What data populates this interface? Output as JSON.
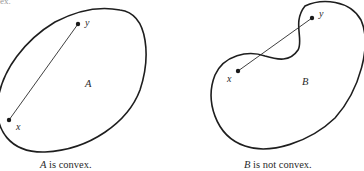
{
  "top_fragment": "ex.",
  "figures": [
    {
      "id": "A",
      "set_label": "A",
      "point_labels": {
        "x": "x",
        "y": "y"
      },
      "caption": {
        "set": "A",
        "text": " is convex."
      },
      "convex": true
    },
    {
      "id": "B",
      "set_label": "B",
      "point_labels": {
        "x": "x",
        "y": "y"
      },
      "caption": {
        "set": "B",
        "text": " is not convex."
      },
      "convex": false
    }
  ],
  "colors": {
    "stroke": "#1e1e1e",
    "text": "#2a2a2a",
    "background": "#ffffff"
  }
}
